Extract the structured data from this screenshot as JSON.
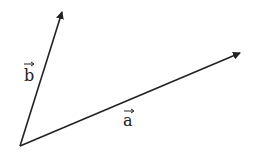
{
  "diagram": {
    "type": "vectors",
    "origin": [
      20,
      146
    ],
    "colors": {
      "stroke": "#222222",
      "background": "#ffffff"
    },
    "vectors": [
      {
        "name": "a",
        "label": "a",
        "tip": [
          240,
          53
        ],
        "label_pos": [
          126,
          121
        ]
      },
      {
        "name": "b",
        "label": "b",
        "tip": [
          62,
          12
        ],
        "label_pos": [
          28,
          75
        ]
      }
    ],
    "arrow_glyph": "→"
  }
}
